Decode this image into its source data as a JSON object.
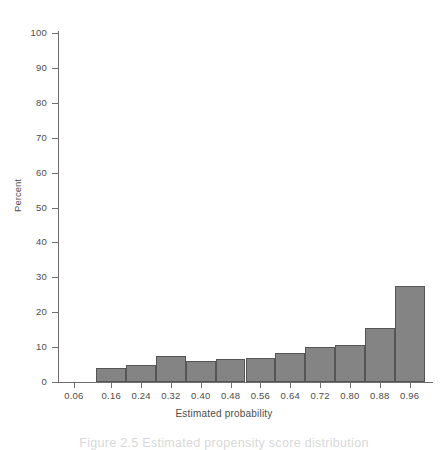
{
  "chart_data": {
    "type": "bar",
    "title": "",
    "subtitle": "",
    "xlabel": "Estimated probability",
    "ylabel": "Percent",
    "xlim": [
      0.02,
      1.02
    ],
    "ylim": [
      0,
      100
    ],
    "grid": false,
    "legend": null,
    "bar_color": "#848484",
    "bar_edge_color": "#555555",
    "axis_color": "#6e6e6e",
    "text_color": "#4d4d4d",
    "background": "#ffffff",
    "y_ticks": [
      0,
      10,
      20,
      30,
      40,
      50,
      60,
      70,
      80,
      90,
      100
    ],
    "y_tick_labels": [
      "0",
      "10",
      "20",
      "30",
      "40",
      "50",
      "60",
      "70",
      "80",
      "90",
      "100"
    ],
    "x_ticks": [
      0.06,
      0.16,
      0.24,
      0.32,
      0.4,
      0.48,
      0.56,
      0.64,
      0.72,
      0.8,
      0.88,
      0.96
    ],
    "x_tick_labels": [
      "0.06",
      "0.16",
      "0.24",
      "0.32",
      "0.40",
      "0.48",
      "0.56",
      "0.64",
      "0.72",
      "0.80",
      "0.88",
      "0.96"
    ],
    "bin_width": 0.08,
    "bins": [
      {
        "left": 0.12,
        "right": 0.2,
        "center": 0.16,
        "value": 4.0
      },
      {
        "left": 0.2,
        "right": 0.28,
        "center": 0.24,
        "value": 5.0
      },
      {
        "left": 0.28,
        "right": 0.36,
        "center": 0.32,
        "value": 7.5
      },
      {
        "left": 0.36,
        "right": 0.44,
        "center": 0.4,
        "value": 6.0
      },
      {
        "left": 0.44,
        "right": 0.52,
        "center": 0.48,
        "value": 6.7
      },
      {
        "left": 0.52,
        "right": 0.6,
        "center": 0.56,
        "value": 6.8
      },
      {
        "left": 0.6,
        "right": 0.68,
        "center": 0.64,
        "value": 8.3
      },
      {
        "left": 0.68,
        "right": 0.76,
        "center": 0.72,
        "value": 10.0
      },
      {
        "left": 0.76,
        "right": 0.84,
        "center": 0.8,
        "value": 10.5
      },
      {
        "left": 0.84,
        "right": 0.92,
        "center": 0.88,
        "value": 15.6
      },
      {
        "left": 0.92,
        "right": 1.0,
        "center": 0.96,
        "value": 27.5
      }
    ],
    "categories": [
      "0.16",
      "0.24",
      "0.32",
      "0.40",
      "0.48",
      "0.56",
      "0.64",
      "0.72",
      "0.80",
      "0.88",
      "0.96"
    ],
    "values": [
      4.0,
      5.0,
      7.5,
      6.0,
      6.7,
      6.8,
      8.3,
      10.0,
      10.5,
      15.6,
      27.5
    ]
  },
  "caption": {
    "text": "Figure 2.5 Estimated propensity score distribution"
  }
}
